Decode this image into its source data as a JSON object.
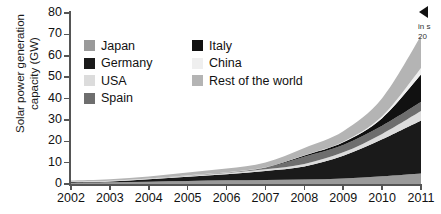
{
  "chart_data": {
    "type": "area",
    "title": "",
    "subtitle": "",
    "xlabel": "",
    "ylabel": "Solar power generation capacity (GW)",
    "ylabel_line1": "Solar power generation",
    "ylabel_line2": "capacity (GW)",
    "categories": [
      "2002",
      "2003",
      "2004",
      "2005",
      "2006",
      "2007",
      "2008",
      "2009",
      "2010",
      "2011"
    ],
    "x": [
      2002,
      2003,
      2004,
      2005,
      2006,
      2007,
      2008,
      2009,
      2010,
      2011
    ],
    "ylim": [
      0,
      80
    ],
    "yticks": [
      0,
      10,
      20,
      30,
      40,
      50,
      60,
      70,
      80
    ],
    "ytick_labels": [
      "0",
      "10",
      "20",
      "30",
      "40",
      "50",
      "60",
      "70",
      "80"
    ],
    "xlim": [
      2002,
      2011
    ],
    "grid": false,
    "stacked": true,
    "legend_position": "inside-top-left",
    "series": [
      {
        "name": "Japan",
        "color": "#9a9a9a",
        "values": [
          0.6,
          0.8,
          1.1,
          1.4,
          1.7,
          1.9,
          2.1,
          2.6,
          3.6,
          4.9
        ]
      },
      {
        "name": "Germany",
        "color": "#1a1a1a",
        "values": [
          0.3,
          0.4,
          1.1,
          2.0,
          2.9,
          4.2,
          6.1,
          10.6,
          17.3,
          24.8
        ]
      },
      {
        "name": "USA",
        "color": "#dcdcdc",
        "values": [
          0.2,
          0.3,
          0.4,
          0.5,
          0.6,
          0.8,
          1.2,
          1.6,
          2.5,
          4.4
        ]
      },
      {
        "name": "Spain",
        "color": "#6e6e6e",
        "values": [
          0.0,
          0.0,
          0.0,
          0.1,
          0.2,
          0.7,
          3.4,
          3.5,
          3.9,
          4.3
        ]
      },
      {
        "name": "Italy",
        "color": "#111111",
        "values": [
          0.0,
          0.0,
          0.0,
          0.0,
          0.0,
          0.1,
          0.5,
          1.2,
          3.5,
          12.8
        ]
      },
      {
        "name": "China",
        "color": "#efefef",
        "values": [
          0.0,
          0.0,
          0.0,
          0.1,
          0.1,
          0.1,
          0.2,
          0.3,
          0.9,
          3.1
        ]
      },
      {
        "name": "Rest of the world",
        "color": "#b4b4b4",
        "values": [
          0.5,
          0.7,
          0.9,
          1.3,
          1.7,
          2.3,
          3.4,
          4.9,
          8.4,
          15.0
        ]
      }
    ],
    "totals": [
      1.6,
      2.2,
      3.5,
      5.4,
      7.2,
      10.1,
      16.9,
      24.7,
      40.1,
      69.3
    ],
    "legend": [
      {
        "label": "Japan",
        "color": "#9a9a9a"
      },
      {
        "label": "Italy",
        "color": "#111111"
      },
      {
        "label": "Germany",
        "color": "#1a1a1a"
      },
      {
        "label": "China",
        "color": "#efefef"
      },
      {
        "label": "USA",
        "color": "#dcdcdc"
      },
      {
        "label": "Rest of the world",
        "color": "#b4b4b4"
      },
      {
        "label": "Spain",
        "color": "#6e6e6e"
      }
    ]
  },
  "annotation": {
    "line1": "in s",
    "line2": "20"
  }
}
